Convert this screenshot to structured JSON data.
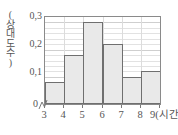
{
  "chart_data": {
    "type": "bar",
    "title": "",
    "subtitle": "",
    "xlabel": "(시간)",
    "ylabel": "(상대도수)",
    "ylabel_chars": "(\n상\n대\n도\n수\n)",
    "categories": [
      "3~4",
      "4~5",
      "5~6",
      "6~7",
      "7~8",
      "8~9"
    ],
    "bin_edges": [
      3,
      4,
      5,
      6,
      7,
      8,
      9
    ],
    "values": [
      0.08,
      0.18,
      0.3,
      0.22,
      0.1,
      0.12
    ],
    "xlim": [
      3,
      9
    ],
    "ylim": [
      0,
      0.32
    ],
    "x_tick_labels": [
      "3",
      "4",
      "5",
      "6",
      "7",
      "8",
      "9"
    ],
    "x_last_tick_label": "9(시간)",
    "y_tick_labels": [
      "0",
      "0,1",
      "0,2",
      "0,3"
    ],
    "y_tick_values": [
      0,
      0.1,
      0.2,
      0.3
    ],
    "zero_label": "0",
    "grid": true,
    "grid_minor_step": 0.02,
    "grid_major_step": 0.1,
    "legend": "none",
    "axis_break": true,
    "bar_fill_color": "#e9e9e9",
    "bar_edge_color": "#6f6f6f",
    "grid_color": "#e2e2e2",
    "axis_color": "#8a8a8a",
    "text_color": "#555555",
    "background_color": "#ffffff"
  }
}
